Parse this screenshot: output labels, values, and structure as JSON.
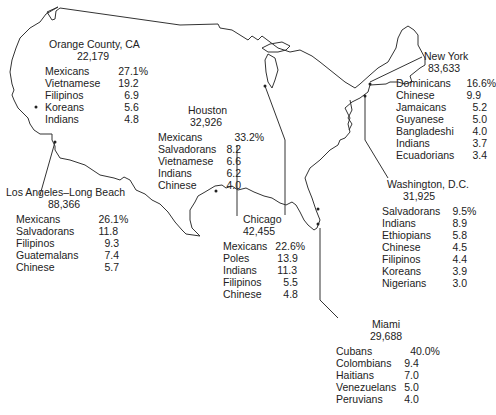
{
  "cities": [
    {
      "id": "orange-county",
      "name": "Orange County, CA",
      "total": "22,179",
      "groups": [
        {
          "name": "Mexicans",
          "value": "27.1%"
        },
        {
          "name": "Vietnamese",
          "value": "19.2"
        },
        {
          "name": "Filipinos",
          "value": "6.9"
        },
        {
          "name": "Koreans",
          "value": "5.6"
        },
        {
          "name": "Indians",
          "value": "4.8"
        }
      ]
    },
    {
      "id": "houston",
      "name": "Houston",
      "total": "32,926",
      "groups": [
        {
          "name": "Mexicans",
          "value": "33.2%"
        },
        {
          "name": "Salvadorans",
          "value": "8.2"
        },
        {
          "name": "Vietnamese",
          "value": "6.6"
        },
        {
          "name": "Indians",
          "value": "6.2"
        },
        {
          "name": "Chinese",
          "value": "4.0"
        }
      ]
    },
    {
      "id": "los-angeles",
      "name": "Los Angeles–Long Beach",
      "total": "88,366",
      "groups": [
        {
          "name": "Mexicans",
          "value": "26.1%"
        },
        {
          "name": "Salvadorans",
          "value": "11.8"
        },
        {
          "name": "Filipinos",
          "value": "9.3"
        },
        {
          "name": "Guatemalans",
          "value": "7.4"
        },
        {
          "name": "Chinese",
          "value": "5.7"
        }
      ]
    },
    {
      "id": "chicago",
      "name": "Chicago",
      "total": "42,455",
      "groups": [
        {
          "name": "Mexicans",
          "value": "22.6%"
        },
        {
          "name": "Poles",
          "value": "13.9"
        },
        {
          "name": "Indians",
          "value": "11.3"
        },
        {
          "name": "Filipinos",
          "value": "5.5"
        },
        {
          "name": "Chinese",
          "value": "4.8"
        }
      ]
    },
    {
      "id": "new-york",
      "name": "New York",
      "total": "83,633",
      "groups": [
        {
          "name": "Dominicans",
          "value": "16.6%"
        },
        {
          "name": "Chinese",
          "value": "9.9"
        },
        {
          "name": "Jamaicans",
          "value": "5.2"
        },
        {
          "name": "Guyanese",
          "value": "5.0"
        },
        {
          "name": "Bangladeshi",
          "value": "4.0"
        },
        {
          "name": "Indians",
          "value": "3.7"
        },
        {
          "name": "Ecuadorians",
          "value": "3.4"
        }
      ]
    },
    {
      "id": "washington-dc",
      "name": "Washington, D.C.",
      "total": "31,925",
      "groups": [
        {
          "name": "Salvadorans",
          "value": "9.5%"
        },
        {
          "name": "Indians",
          "value": "8.9"
        },
        {
          "name": "Ethiopians",
          "value": "5.8"
        },
        {
          "name": "Chinese",
          "value": "4.5"
        },
        {
          "name": "Filipinos",
          "value": "4.4"
        },
        {
          "name": "Koreans",
          "value": "3.9"
        },
        {
          "name": "Nigerians",
          "value": "3.0"
        }
      ]
    },
    {
      "id": "miami",
      "name": "Miami",
      "total": "29,688",
      "groups": [
        {
          "name": "Cubans",
          "value": "40.0%"
        },
        {
          "name": "Colombians",
          "value": "9.4"
        },
        {
          "name": "Haitians",
          "value": "7.0"
        },
        {
          "name": "Venezuelans",
          "value": "5.0"
        },
        {
          "name": "Peruvians",
          "value": "4.0"
        }
      ]
    }
  ]
}
